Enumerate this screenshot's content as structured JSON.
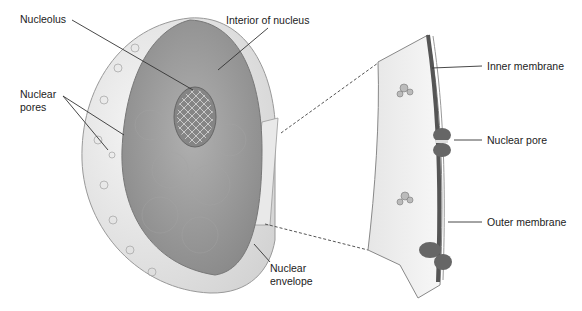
{
  "diagram": {
    "labels": {
      "nucleolus": "Nucleolus",
      "interior": "Interior of nucleus",
      "pores_line1": "Nuclear",
      "pores_line2": "pores",
      "envelope_line1": "Nuclear",
      "envelope_line2": "envelope",
      "inner_membrane": "Inner membrane",
      "nuclear_pore": "Nuclear pore",
      "outer_membrane": "Outer membrane"
    },
    "colors": {
      "interior": "#9a9a9a",
      "shell": "#ececec",
      "nucleolus": "#7a7a7a",
      "membrane_dark": "#555555",
      "label_text": "#222222"
    }
  }
}
